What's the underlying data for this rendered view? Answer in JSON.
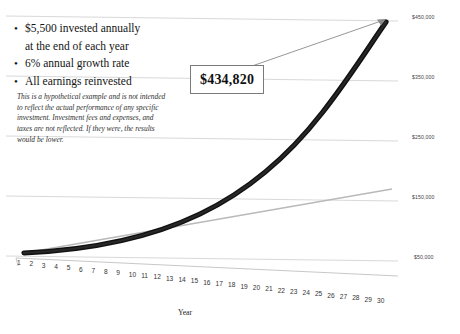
{
  "bullets": [
    {
      "marker": "•",
      "text": "$5,500 invested annually"
    },
    {
      "marker": "",
      "text": "at the end of each year"
    },
    {
      "marker": "•",
      "text": "6% annual growth rate"
    },
    {
      "marker": "•",
      "text": "All earnings reinvested"
    }
  ],
  "disclaimer": "This is a hypothetical example and is not intended to reflect the actual performance of any specific investment. Investment fees and expenses, and taxes are not reflected. If they were, the results would be lower.",
  "callout": {
    "value": "$434,820"
  },
  "colors": {
    "curve": "#111111",
    "reference_line": "#b9b9b9",
    "gridline": "#d9d9d9",
    "callout_border": "#7a7a7a",
    "text": "#1a1a1a"
  },
  "chart_data": {
    "type": "line",
    "title": "",
    "xlabel": "Year",
    "ylabel": "",
    "grid": true,
    "legend": "none",
    "xlim": [
      1,
      30
    ],
    "ylim": [
      0,
      500000
    ],
    "ytick_labels": [
      "$450,000",
      "$350,000",
      "$250,000",
      "$150,000",
      "$50,000"
    ],
    "ytick_values": [
      450000,
      350000,
      250000,
      150000,
      50000
    ],
    "categories": [
      1,
      2,
      3,
      4,
      5,
      6,
      7,
      8,
      9,
      10,
      11,
      12,
      13,
      14,
      15,
      16,
      17,
      18,
      19,
      20,
      21,
      22,
      23,
      24,
      25,
      26,
      27,
      28,
      29,
      30
    ],
    "xtick_labels": [
      "1",
      "2",
      "3",
      "4",
      "5",
      "6",
      "7",
      "8",
      "9",
      "10",
      "11",
      "12",
      "13",
      "14",
      "15",
      "16",
      "17",
      "18",
      "19",
      "20",
      "21",
      "22",
      "23",
      "24",
      "25",
      "26",
      "27",
      "28",
      "29",
      "30"
    ],
    "annotations": [
      {
        "label": "$434,820",
        "x": 30,
        "y": 434820
      }
    ],
    "series": [
      {
        "name": "Account value (6% growth, reinvested)",
        "style": "thick-black",
        "values": [
          5500,
          11330,
          17510,
          24060,
          31004,
          38364,
          46166,
          54436,
          63202,
          72494,
          82344,
          92785,
          103852,
          115583,
          128018,
          141199,
          155171,
          169981,
          185680,
          202321,
          219960,
          238658,
          258477,
          279486,
          301755,
          325360,
          350382,
          376905,
          405019,
          434820
        ]
      },
      {
        "name": "Total contributions",
        "style": "thin-gray",
        "values": [
          5500,
          11000,
          16500,
          22000,
          27500,
          33000,
          38500,
          44000,
          49500,
          55000,
          60500,
          66000,
          71500,
          77000,
          82500,
          88000,
          93500,
          99000,
          104500,
          110000,
          115500,
          121000,
          126500,
          132000,
          137500,
          143000,
          148500,
          154000,
          159500,
          165000
        ]
      }
    ]
  }
}
